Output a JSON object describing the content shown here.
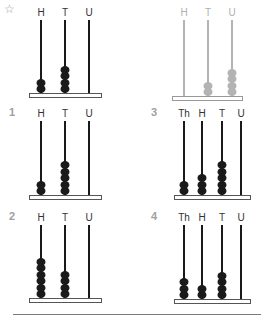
{
  "star_icon": "☆",
  "colors": {
    "dark": "#1a1a1a",
    "grey": "#b3b3b3",
    "label_dark": "#333333",
    "label_grey": "#b0b0b0"
  },
  "examples": [
    {
      "id": "example-left",
      "style": "dark",
      "columns": [
        "H",
        "T",
        "U"
      ],
      "beads": [
        2,
        4,
        0
      ],
      "rod_x": [
        41,
        65,
        89
      ],
      "rod_top": 20,
      "base": {
        "x": 29,
        "y": 93,
        "w": 73
      }
    },
    {
      "id": "example-right",
      "style": "grey",
      "columns": [
        "H",
        "T",
        "U"
      ],
      "beads": [
        0,
        2,
        4
      ],
      "rod_x": [
        184,
        208,
        232
      ],
      "rod_top": 20,
      "base": {
        "x": 172,
        "y": 96,
        "w": 71
      }
    }
  ],
  "problems": [
    {
      "number": "1",
      "num_x": 9,
      "num_y": 106,
      "columns": [
        "H",
        "T",
        "U"
      ],
      "beads": [
        2,
        5,
        0
      ],
      "rod_x": [
        41,
        65,
        89
      ],
      "rod_top": 121,
      "base": {
        "x": 29,
        "y": 195,
        "w": 73
      }
    },
    {
      "number": "3",
      "num_x": 151,
      "num_y": 106,
      "columns": [
        "Th",
        "H",
        "T",
        "U"
      ],
      "beads": [
        2,
        3,
        5,
        0
      ],
      "rod_x": [
        184,
        202,
        222,
        241
      ],
      "rod_top": 121,
      "base": {
        "x": 174,
        "y": 195,
        "w": 77
      }
    },
    {
      "number": "2",
      "num_x": 9,
      "num_y": 210,
      "columns": [
        "H",
        "T",
        "U"
      ],
      "beads": [
        6,
        4,
        0
      ],
      "rod_x": [
        41,
        65,
        89
      ],
      "rod_top": 225,
      "base": {
        "x": 29,
        "y": 298,
        "w": 73
      }
    },
    {
      "number": "4",
      "num_x": 151,
      "num_y": 210,
      "columns": [
        "Th",
        "H",
        "T",
        "U"
      ],
      "beads": [
        3,
        2,
        4,
        0
      ],
      "rod_x": [
        184,
        202,
        222,
        241
      ],
      "rod_top": 225,
      "base": {
        "x": 174,
        "y": 299,
        "w": 77
      }
    }
  ]
}
